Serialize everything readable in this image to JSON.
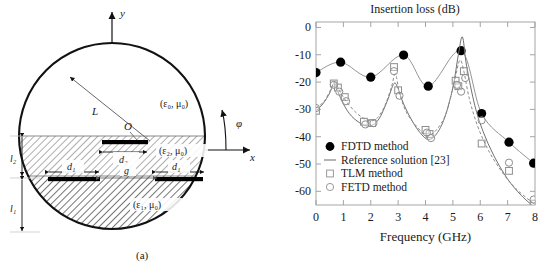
{
  "figure": {
    "panel_a_caption": "(a)",
    "panel_b_caption": "(b)"
  },
  "diagram": {
    "axis_y_label": "y",
    "axis_x_label": "x",
    "angle_label": "φ",
    "radius_label": "L",
    "origin_label": "O",
    "region_outer_label": "(ε₀, μ₀)",
    "region_mid_label": "(ε₂, μ₀)",
    "region_inner_label": "(ε₁, μ₀)",
    "dim_l2": "l₂",
    "dim_l1": "l₁",
    "dim_d2": "d₂",
    "dim_d1_left": "d₁",
    "dim_d1_right": "d₁",
    "dim_g": "g"
  },
  "chart_data": {
    "type": "line",
    "title": "Insertion loss (dB)",
    "xlabel": "Frequency (GHz)",
    "ylabel": "",
    "xlim": [
      0,
      8
    ],
    "ylim": [
      -65,
      2
    ],
    "xticks": [
      0,
      1,
      2,
      3,
      4,
      5,
      6,
      7,
      8
    ],
    "yticks": [
      0,
      -10,
      -20,
      -30,
      -40,
      -50,
      -60
    ],
    "grid": false,
    "legend_position": "lower-left",
    "legend": [
      {
        "label": "FDTD method",
        "marker": "filled-circle"
      },
      {
        "label": "Reference solution [23]",
        "marker": "line"
      },
      {
        "label": "TLM method",
        "marker": "open-square"
      },
      {
        "label": "FETD method",
        "marker": "open-circle"
      }
    ],
    "series": [
      {
        "name": "FDTD method",
        "marker": "filled-circle",
        "x": [
          0.0,
          0.9,
          2.0,
          3.2,
          4.1,
          5.3,
          6.05,
          7.05,
          7.95
        ],
        "y": [
          -16.5,
          -12.7,
          -18.2,
          -10.1,
          -21.5,
          -8.5,
          -31.5,
          -42.0,
          -49.7
        ]
      },
      {
        "name": "Reference solution [23]",
        "marker": "line",
        "x": [
          0.0,
          0.25,
          0.5,
          0.65,
          0.8,
          1.0,
          1.3,
          1.7,
          2.0,
          2.3,
          2.6,
          2.85,
          3.0,
          3.2,
          3.5,
          3.8,
          4.1,
          4.4,
          4.7,
          5.0,
          5.2,
          5.35,
          5.5,
          5.8,
          6.1,
          6.5,
          7.0,
          7.5,
          8.0
        ],
        "y": [
          -30.5,
          -28.0,
          -24.0,
          -20.5,
          -23.5,
          -28.0,
          -32.5,
          -35.5,
          -36.0,
          -33.5,
          -27.0,
          -20.5,
          -22.5,
          -28.0,
          -34.0,
          -38.5,
          -41.0,
          -39.0,
          -33.0,
          -22.0,
          -10.0,
          -3.5,
          -14.0,
          -28.5,
          -38.0,
          -47.0,
          -55.5,
          -61.5,
          -66.0
        ]
      },
      {
        "name": "TLM method",
        "marker": "open-square",
        "x": [
          0.0,
          0.65,
          0.8,
          1.05,
          1.75,
          2.05,
          2.85,
          3.0,
          4.0,
          4.15,
          5.1,
          5.2,
          5.4,
          6.05,
          7.05,
          7.95
        ],
        "y": [
          -30.5,
          -20.5,
          -22.0,
          -25.5,
          -34.5,
          -35.0,
          -14.5,
          -23.0,
          -37.5,
          -39.0,
          -19.5,
          -21.5,
          -16.0,
          -42.5,
          -52.5,
          -64.5
        ]
      },
      {
        "name": "FETD method",
        "marker": "open-circle",
        "x": [
          0.0,
          0.65,
          0.85,
          1.1,
          1.8,
          2.1,
          2.85,
          3.05,
          4.05,
          4.2,
          5.15,
          5.3,
          5.45,
          6.05,
          7.05,
          7.95
        ],
        "y": [
          -29.5,
          -21.0,
          -23.5,
          -27.0,
          -35.5,
          -35.0,
          -16.0,
          -25.0,
          -38.5,
          -40.5,
          -21.0,
          -23.5,
          -18.5,
          -34.0,
          -49.5,
          -63.0
        ]
      },
      {
        "name": "TLM curve",
        "marker": "dashed-line",
        "x": [
          0.0,
          0.3,
          0.55,
          0.68,
          0.85,
          1.1,
          1.5,
          1.9,
          2.2,
          2.5,
          2.75,
          2.9,
          3.05,
          3.3,
          3.7,
          4.05,
          4.4,
          4.75,
          5.05,
          5.25,
          5.4,
          5.6,
          5.9,
          6.3,
          6.8,
          7.3,
          7.95
        ],
        "y": [
          -29.5,
          -27.0,
          -22.5,
          -20.0,
          -23.0,
          -27.0,
          -31.5,
          -34.0,
          -33.5,
          -29.0,
          -22.0,
          -17.0,
          -24.0,
          -31.0,
          -36.5,
          -39.5,
          -37.5,
          -31.5,
          -20.0,
          -12.0,
          -16.0,
          -26.0,
          -36.0,
          -45.0,
          -53.0,
          -59.0,
          -64.5
        ]
      }
    ]
  }
}
